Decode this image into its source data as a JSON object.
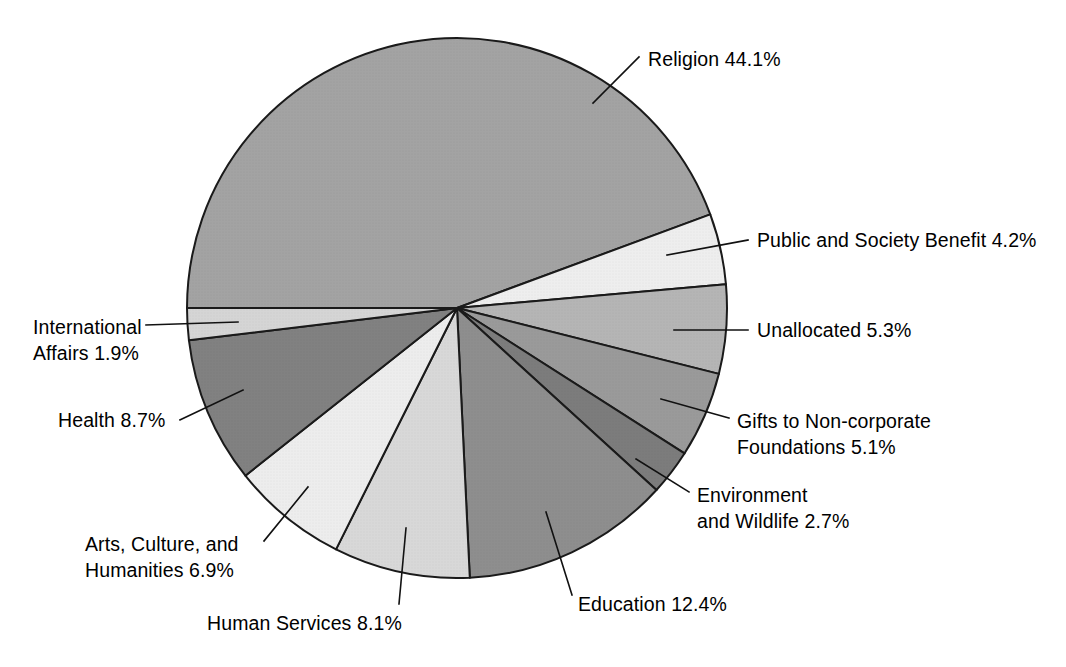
{
  "chart_data": {
    "type": "pie",
    "title": "",
    "subtitle": "",
    "xlabel": "",
    "ylabel": "",
    "units": "percent",
    "legend_position": "none",
    "grid": false,
    "label_format": "{category} {value}%",
    "start_angle_deg": 180,
    "direction": "clockwise",
    "categories": [
      "Religion",
      "Public and Society Benefit",
      "Unallocated",
      "Gifts to Non-corporate Foundations",
      "Environment and Wildlife",
      "Education",
      "Human Services",
      "Arts, Culture, and Humanities",
      "Health",
      "International Affairs"
    ],
    "values": [
      44.1,
      4.2,
      5.3,
      5.1,
      2.7,
      12.4,
      8.1,
      6.9,
      8.7,
      1.9
    ],
    "total": 99.4,
    "slices": [
      {
        "id": "religion",
        "label": "Religion",
        "value": 44.1,
        "display": "Religion 44.1%",
        "lines": [
          "Religion 44.1%"
        ],
        "color": "#a3a3a3"
      },
      {
        "id": "public-and-society-benefit",
        "label": "Public and Society Benefit",
        "value": 4.2,
        "display": "Public and Society Benefit 4.2%",
        "lines": [
          "Public and Society Benefit 4.2%"
        ],
        "color": "#eeeeee"
      },
      {
        "id": "unallocated",
        "label": "Unallocated",
        "value": 5.3,
        "display": "Unallocated 5.3%",
        "lines": [
          "Unallocated 5.3%"
        ],
        "color": "#b5b5b5"
      },
      {
        "id": "gifts-to-non-corporate-foundations",
        "label": "Gifts to Non-corporate Foundations",
        "value": 5.1,
        "display": "Gifts to Non-corporate Foundations 5.1%",
        "lines": [
          "Gifts to Non-corporate",
          "Foundations 5.1%"
        ],
        "color": "#9a9a9a"
      },
      {
        "id": "environment-and-wildlife",
        "label": "Environment and Wildlife",
        "value": 2.7,
        "display": "Environment and Wildlife 2.7%",
        "lines": [
          "Environment",
          "and Wildlife 2.7%"
        ],
        "color": "#7c7c7c"
      },
      {
        "id": "education",
        "label": "Education",
        "value": 12.4,
        "display": "Education 12.4%",
        "lines": [
          "Education 12.4%"
        ],
        "color": "#8e8e8e"
      },
      {
        "id": "human-services",
        "label": "Human Services",
        "value": 8.1,
        "display": "Human Services 8.1%",
        "lines": [
          "Human Services 8.1%"
        ],
        "color": "#d8d8d8"
      },
      {
        "id": "arts-culture-and-humanities",
        "label": "Arts, Culture, and Humanities",
        "value": 6.9,
        "display": "Arts, Culture, and Humanities 6.9%",
        "lines": [
          "Arts, Culture, and",
          "Humanities 6.9%"
        ],
        "color": "#ededed"
      },
      {
        "id": "health",
        "label": "Health",
        "value": 8.7,
        "display": "Health 8.7%",
        "lines": [
          "Health 8.7%"
        ],
        "color": "#818181"
      },
      {
        "id": "international-affairs",
        "label": "International Affairs",
        "value": 1.9,
        "display": "International Affairs 1.9%",
        "lines": [
          "International",
          "Affairs 1.9%"
        ],
        "color": "#d5d5d5"
      }
    ],
    "geometry": {
      "center_x": 457,
      "center_y": 308,
      "radius": 270
    },
    "callouts": [
      {
        "id": "religion",
        "anchor": "start",
        "text_x": 648,
        "text_y": 66,
        "line": [
          [
            593,
            103
          ],
          [
            639,
            57
          ]
        ]
      },
      {
        "id": "public-and-society-benefit",
        "anchor": "start",
        "text_x": 757,
        "text_y": 247,
        "line": [
          [
            667,
            255
          ],
          [
            748,
            240
          ]
        ]
      },
      {
        "id": "unallocated",
        "anchor": "start",
        "text_x": 757,
        "text_y": 337,
        "line": [
          [
            674,
            330
          ],
          [
            748,
            330
          ]
        ]
      },
      {
        "id": "gifts-to-non-corporate-foundations",
        "anchor": "start",
        "text_x": 737,
        "text_y": 428,
        "line": [
          [
            661,
            399
          ],
          [
            729,
            418
          ]
        ]
      },
      {
        "id": "environment-and-wildlife",
        "anchor": "start",
        "text_x": 697,
        "text_y": 502,
        "line": [
          [
            636,
            459
          ],
          [
            689,
            492
          ]
        ]
      },
      {
        "id": "education",
        "anchor": "start",
        "text_x": 578,
        "text_y": 611,
        "line": [
          [
            546,
            512
          ],
          [
            572,
            595
          ]
        ]
      },
      {
        "id": "human-services",
        "anchor": "start",
        "text_x": 207,
        "text_y": 630,
        "line": [
          [
            406,
            528
          ],
          [
            399,
            604
          ]
        ]
      },
      {
        "id": "arts-culture-and-humanities",
        "anchor": "start",
        "text_x": 85,
        "text_y": 551,
        "line": [
          [
            308,
            487
          ],
          [
            264,
            541
          ]
        ]
      },
      {
        "id": "health",
        "anchor": "start",
        "text_x": 58,
        "text_y": 427,
        "line": [
          [
            243,
            390
          ],
          [
            180,
            420
          ]
        ]
      },
      {
        "id": "international-affairs",
        "anchor": "start",
        "text_x": 33,
        "text_y": 334,
        "line": [
          [
            238,
            322
          ],
          [
            146,
            325
          ]
        ]
      }
    ]
  }
}
